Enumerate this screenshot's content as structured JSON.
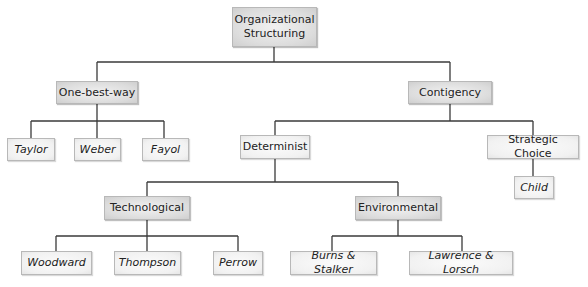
{
  "diagram": {
    "title": "Organizational Structuring",
    "nodes": {
      "root": {
        "label": "Organizational Structuring",
        "line1": "Organizational",
        "line2": "Structuring"
      },
      "one_best_way": {
        "label": "One-best-way"
      },
      "taylor": {
        "label": "Taylor"
      },
      "weber": {
        "label": "Weber"
      },
      "fayol": {
        "label": "Fayol"
      },
      "contigency": {
        "label": "Contigency"
      },
      "determinist": {
        "label": "Determinist"
      },
      "strategic_choice": {
        "label": "Strategic Choice"
      },
      "child": {
        "label": "Child"
      },
      "technological": {
        "label": "Technological"
      },
      "environmental": {
        "label": "Environmental"
      },
      "woodward": {
        "label": "Woodward"
      },
      "thompson": {
        "label": "Thompson"
      },
      "perrow": {
        "label": "Perrow"
      },
      "burns_stalker": {
        "label": "Burns & Stalker"
      },
      "lawrence_lorsch": {
        "label": "Lawrence & Lorsch"
      }
    },
    "edges": [
      [
        "root",
        "one_best_way"
      ],
      [
        "root",
        "contigency"
      ],
      [
        "one_best_way",
        "taylor"
      ],
      [
        "one_best_way",
        "weber"
      ],
      [
        "one_best_way",
        "fayol"
      ],
      [
        "contigency",
        "determinist"
      ],
      [
        "contigency",
        "strategic_choice"
      ],
      [
        "strategic_choice",
        "child"
      ],
      [
        "determinist",
        "technological"
      ],
      [
        "determinist",
        "environmental"
      ],
      [
        "technological",
        "woodward"
      ],
      [
        "technological",
        "thompson"
      ],
      [
        "technological",
        "perrow"
      ],
      [
        "environmental",
        "burns_stalker"
      ],
      [
        "environmental",
        "lawrence_lorsch"
      ]
    ],
    "colors": {
      "line": "#3a3a3a",
      "border": "#b8b8b8",
      "dark_fill": "#d9d9d9",
      "light_fill": "#f2f2f2"
    }
  }
}
